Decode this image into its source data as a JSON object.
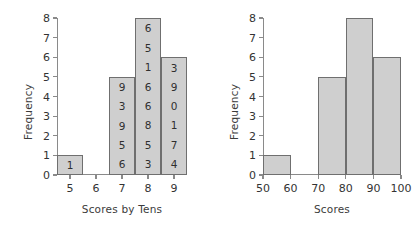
{
  "chart_data": [
    {
      "type": "bar",
      "id": "stemplot-histogram",
      "title": "",
      "xlabel": "Scores by Tens",
      "ylabel": "Frequency",
      "categories": [
        "5",
        "6",
        "7",
        "8",
        "9"
      ],
      "values": [
        1,
        0,
        5,
        8,
        6
      ],
      "ylim": [
        0,
        8
      ],
      "yticks": [
        0,
        1,
        2,
        3,
        4,
        5,
        6,
        7,
        8
      ],
      "xticks": [
        "5",
        "6",
        "7",
        "8",
        "9"
      ],
      "tick_label_position": "bar-center",
      "grid": false,
      "legend": null,
      "bar_digit_labels": [
        [
          "1"
        ],
        [],
        [
          "9",
          "3",
          "9",
          "5",
          "6"
        ],
        [
          "6",
          "5",
          "1",
          "6",
          "6",
          "8",
          "5",
          "3"
        ],
        [
          "3",
          "9",
          "0",
          "1",
          "7",
          "4"
        ]
      ],
      "bar_fill": "#cfcfcf",
      "bar_border": "#6f6f6f"
    },
    {
      "type": "bar",
      "id": "scores-histogram",
      "title": "",
      "xlabel": "Scores",
      "ylabel": "Frequency",
      "bin_edges": [
        50,
        60,
        70,
        80,
        90,
        100
      ],
      "categories": [
        "50-60",
        "60-70",
        "70-80",
        "80-90",
        "90-100"
      ],
      "values": [
        1,
        0,
        5,
        8,
        6
      ],
      "ylim": [
        0,
        8
      ],
      "yticks": [
        0,
        1,
        2,
        3,
        4,
        5,
        6,
        7,
        8
      ],
      "xticks": [
        "50",
        "60",
        "70",
        "80",
        "90",
        "100"
      ],
      "tick_label_position": "bin-edge",
      "grid": false,
      "legend": null,
      "bar_fill": "#cfcfcf",
      "bar_border": "#6f6f6f"
    }
  ],
  "left_chart": {
    "ylabel": "Frequency",
    "xlabel": "Scores by Tens",
    "yticks": [
      "0",
      "1",
      "2",
      "3",
      "4",
      "5",
      "6",
      "7",
      "8"
    ],
    "xticks": [
      "5",
      "6",
      "7",
      "8",
      "9"
    ]
  },
  "right_chart": {
    "ylabel": "Frequency",
    "xlabel": "Scores",
    "yticks": [
      "0",
      "1",
      "2",
      "3",
      "4",
      "5",
      "6",
      "7",
      "8"
    ],
    "xticks": [
      "50",
      "60",
      "70",
      "80",
      "90",
      "100"
    ]
  }
}
